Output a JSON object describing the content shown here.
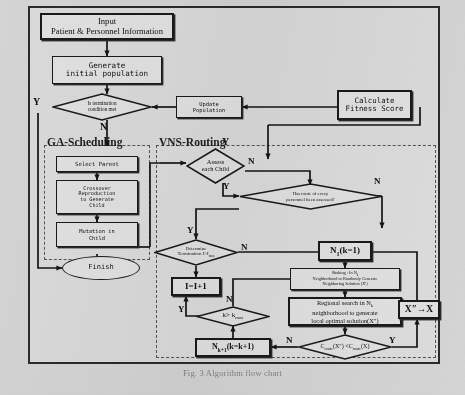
{
  "figure": {
    "kind": "flowchart",
    "caption": "Fig. 3  Algorithm flow chart"
  },
  "groups": [
    {
      "id": "ga",
      "title": "GA-Scheduling"
    },
    {
      "id": "vns",
      "title": "VNS-Routing"
    }
  ],
  "nodes": {
    "input": {
      "line1": "Input",
      "line2": "Patient & Personnel Information"
    },
    "generate": {
      "line1": "Generate",
      "line2": "initial population"
    },
    "terminate": {
      "line1": "Is termination",
      "line2": "condition met"
    },
    "update": {
      "line1": "Update",
      "line2": "Population"
    },
    "calculate": {
      "line1": "Calculate",
      "line2": "Fitness Score"
    },
    "select_parent": {
      "line1": "Select Parent"
    },
    "crossover": {
      "line1": "Crossover",
      "line2": "Reproduction",
      "line3": "to Generate",
      "line4": "Child"
    },
    "mutation": {
      "line1": "Mutation in",
      "line2": "Child"
    },
    "finish": {
      "line1": "Finish"
    },
    "assess": {
      "line1": "Assess",
      "line2": "each Child"
    },
    "has_route": {
      "line1": "Has route of every",
      "line2": "personnel been assessed?"
    },
    "determine": {
      "line1": "Determine",
      "line2": "Termination I>I",
      "sub": "max"
    },
    "iplus": {
      "line1": "I=I+1"
    },
    "kmax": {
      "line1": "k> k",
      "sub": "max"
    },
    "n1": {
      "line1": "N",
      "sub": "1",
      "line2": "(k=1)"
    },
    "shaking": {
      "line1": "Shaking : In N",
      "sub1": "k",
      "line2": "Neighborhood to Randomly Generate",
      "line3": "Neighboring Solution (X')"
    },
    "regional": {
      "line1": "Regional search in N",
      "sub1": "k",
      "line2": "neighborhood to generate",
      "line3": "local optimal solution(X″)"
    },
    "nkplus": {
      "line1": "N",
      "sub": "k+1",
      "line2": "(k=k+1)"
    },
    "compare": {
      "left": "C",
      "leftsub": "route",
      "mid": "(X″) <C",
      "midsub": "route",
      "right": "(X)"
    },
    "xassign": {
      "line1": "X″→X"
    }
  },
  "edge_labels": [
    {
      "id": "term-yes",
      "text": "Y"
    },
    {
      "id": "term-no",
      "text": "N"
    },
    {
      "id": "vns-corner",
      "text": "Y"
    },
    {
      "id": "assess-no",
      "text": "N"
    },
    {
      "id": "assess-yes",
      "text": "Y"
    },
    {
      "id": "hasroute-no",
      "text": "N"
    },
    {
      "id": "det-yes",
      "text": "Y"
    },
    {
      "id": "det-no",
      "text": "N"
    },
    {
      "id": "kmax-no",
      "text": "N"
    },
    {
      "id": "kmax-yes",
      "text": "Y"
    },
    {
      "id": "cmp-no",
      "text": "N"
    },
    {
      "id": "cmp-yes",
      "text": "Y"
    }
  ],
  "colors": {
    "paper": "#d6d6d6",
    "node_fill": "#e3e3e3",
    "stroke": "#1a1a1a",
    "group_stroke": "#555555"
  }
}
